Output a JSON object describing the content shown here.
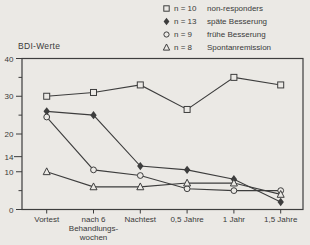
{
  "figure": {
    "y_axis_title": "BDI-Werte",
    "colors": {
      "background": "#ebe9e5",
      "line": "#3d3d3d",
      "text": "#3a3a3a"
    }
  },
  "legend": {
    "position": "top-right",
    "items": [
      {
        "marker": "open-square",
        "count_label": "n = 10",
        "name": "non-responders"
      },
      {
        "marker": "filled-diamond",
        "count_label": "n = 13",
        "name": "späte Besserung"
      },
      {
        "marker": "open-circle",
        "count_label": "n = 9",
        "name": "frühe Besserung"
      },
      {
        "marker": "open-triangle",
        "count_label": "n = 8",
        "name": "Spontanremission"
      }
    ]
  },
  "chart_data": {
    "type": "line",
    "title": "",
    "ylabel": "BDI-Werte",
    "xlabel": "",
    "ylim": [
      0,
      40
    ],
    "y_major_ticks": [
      40,
      30,
      20,
      14,
      10,
      0
    ],
    "y_minor_ticks": [
      35,
      25,
      5
    ],
    "grid": false,
    "legend_position": "top-right",
    "categories": [
      "Vortest",
      "nach 6 Behandlungswochen",
      "Nachtest",
      "0,5 Jahre",
      "1 Jahr",
      "1,5 Jahre"
    ],
    "category_labels": [
      [
        "Vortest"
      ],
      [
        "nach 6",
        "Behandlungs-",
        "wochen"
      ],
      [
        "Nachtest"
      ],
      [
        "0,5 Jahre"
      ],
      [
        "1 Jahr"
      ],
      [
        "1,5 Jahre"
      ]
    ],
    "series": [
      {
        "name": "non-responders",
        "n": 10,
        "marker": "open-square",
        "values": [
          30,
          31,
          33,
          26.5,
          35,
          33
        ]
      },
      {
        "name": "späte Besserung",
        "n": 13,
        "marker": "filled-diamond",
        "values": [
          26,
          25,
          11.5,
          10.5,
          8,
          2
        ]
      },
      {
        "name": "frühe Besserung",
        "n": 9,
        "marker": "open-circle",
        "values": [
          24.5,
          10.5,
          9,
          5.5,
          5,
          5
        ]
      },
      {
        "name": "Spontanremission",
        "n": 8,
        "marker": "open-triangle",
        "values": [
          10,
          6,
          6,
          7,
          7,
          4
        ]
      }
    ]
  }
}
